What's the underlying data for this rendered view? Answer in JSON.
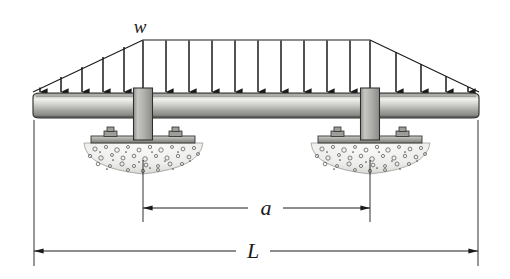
{
  "figure": {
    "type": "engineering-free-body-diagram",
    "background_color": "#ffffff",
    "line_color": "#1a1a1a"
  },
  "labels": {
    "load": "w",
    "support_spacing": "a",
    "total_length": "L"
  },
  "beam": {
    "name": "horizontal-beam",
    "x_left": 33,
    "x_right": 479,
    "y_top": 93,
    "y_bottom": 118,
    "fill_light": "#e8e8e6",
    "fill_mid": "#a9a9a4",
    "fill_dark": "#6f6f6b",
    "outline": "#2b2b2b"
  },
  "load_distribution": {
    "name": "distributed-load",
    "shape": "trapezoidal",
    "plateau_y": 40,
    "baseline_y": 92,
    "left_start_x": 33,
    "plateau_start_x": 143,
    "plateau_end_x": 370,
    "right_end_x": 479,
    "arrow_count": 16,
    "arrow_xs": [
      40,
      61,
      82,
      103,
      124,
      143,
      166,
      189,
      212,
      235,
      258,
      281,
      304,
      327,
      350,
      370,
      396,
      421,
      446,
      468
    ],
    "description": "Linearly increasing from zero at both ends to a uniform plateau of intensity w over the central region"
  },
  "supports": [
    {
      "name": "left-support",
      "column_center_x": 143,
      "column_width": 19,
      "column_top_y": 88,
      "column_bottom_y": 140,
      "baseplate_y": 136,
      "baseplate_half_width": 52,
      "baseplate_height": 7,
      "foundation_top_y": 143,
      "foundation_half_width": 60,
      "foundation_depth": 30,
      "bolt_offsets": [
        -34,
        34
      ]
    },
    {
      "name": "right-support",
      "column_center_x": 370,
      "column_width": 19,
      "column_top_y": 88,
      "column_bottom_y": 140,
      "baseplate_y": 136,
      "baseplate_half_width": 52,
      "baseplate_height": 7,
      "foundation_top_y": 143,
      "foundation_half_width": 60,
      "foundation_depth": 30,
      "bolt_offsets": [
        -34,
        34
      ]
    }
  ],
  "dimensions": [
    {
      "name": "dimension-a",
      "label": "a",
      "from_x": 143,
      "to_x": 370,
      "line_y": 208,
      "label_x": 265,
      "label_y": 205,
      "extension_top_y": 160,
      "extension_bottom_y": 222,
      "gap_left_x": 248,
      "gap_right_x": 283
    },
    {
      "name": "dimension-L",
      "label": "L",
      "from_x": 34,
      "to_x": 478,
      "line_y": 251,
      "label_x": 252,
      "label_y": 248,
      "extension_top_y": 120,
      "extension_bottom_y": 266,
      "gap_left_x": 236,
      "gap_right_x": 270
    }
  ],
  "colors": {
    "steel_light": "#efefed",
    "steel_mid": "#b4b4b0",
    "steel_dark": "#737370",
    "column_fill": "#b9b9b5",
    "plate_fill": "#9a9a96",
    "concrete_fill": "#f2f2f0",
    "concrete_speck": "#5a5a57",
    "ink": "#1a1a1a"
  }
}
